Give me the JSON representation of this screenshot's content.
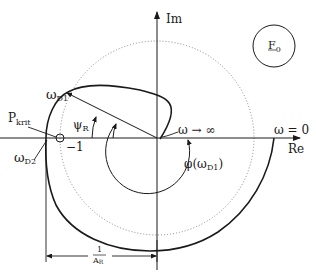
{
  "diagram": {
    "type": "nyquist-plot",
    "axes": {
      "imaginary_label": "Im",
      "real_label": "Re"
    },
    "labels": {
      "minus_one": "−1",
      "p_krit_main": "P",
      "p_krit_sub": "krit",
      "omega_d1_main": "ω",
      "omega_d1_sub": "D1",
      "omega_d2_main": "ω",
      "omega_d2_sub": "D2",
      "psi_r_main": "ψ",
      "psi_r_sub": "R",
      "omega_inf": "ω → ∞",
      "omega_zero": "ω = 0",
      "phi_prefix": "φ(ω",
      "phi_sub": "D1",
      "phi_suffix": ")",
      "f0_main": "F",
      "f0_sub": "0",
      "gain_num": "1",
      "gain_den_main": "A",
      "gain_den_sub": "R"
    },
    "colors": {
      "stroke": "#1a1a1a",
      "dotted": "#888888",
      "background": "#ffffff"
    }
  }
}
